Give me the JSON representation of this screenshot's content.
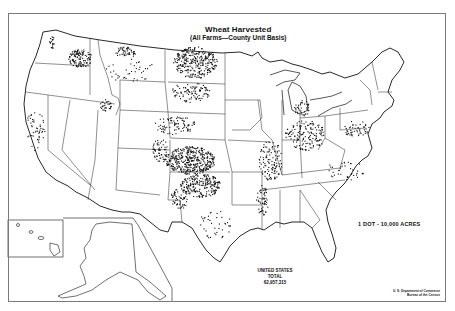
{
  "map": {
    "title": "Wheat Harvested",
    "subtitle": "(All Farms—County Unit Basis)",
    "legend": "1 DOT - 10,000 ACRES",
    "total": {
      "line1": "UNITED STATES",
      "line2": "TOTAL",
      "value": "62,957,315"
    },
    "credit": {
      "line1": "U. S. Department of Commerce",
      "line2": "Bureau of the Census"
    },
    "colors": {
      "ink": "#111111",
      "border": "#7a7a7a",
      "background": "#ffffff"
    },
    "dot_clusters": [
      {
        "name": "palouse-wa",
        "cx": 80,
        "cy": 58,
        "rx": 12,
        "ry": 9,
        "n": 120
      },
      {
        "name": "nw-washington",
        "cx": 52,
        "cy": 42,
        "rx": 3,
        "ry": 6,
        "n": 20
      },
      {
        "name": "north-montana",
        "cx": 125,
        "cy": 52,
        "rx": 10,
        "ry": 6,
        "n": 50
      },
      {
        "name": "montana-scatter",
        "cx": 130,
        "cy": 70,
        "rx": 25,
        "ry": 12,
        "n": 40
      },
      {
        "name": "north-dakota",
        "cx": 195,
        "cy": 62,
        "rx": 22,
        "ry": 16,
        "n": 300
      },
      {
        "name": "south-dakota",
        "cx": 190,
        "cy": 92,
        "rx": 20,
        "ry": 10,
        "n": 100
      },
      {
        "name": "nebraska",
        "cx": 175,
        "cy": 125,
        "rx": 22,
        "ry": 9,
        "n": 90
      },
      {
        "name": "kansas",
        "cx": 190,
        "cy": 160,
        "rx": 25,
        "ry": 14,
        "n": 420
      },
      {
        "name": "oklahoma",
        "cx": 200,
        "cy": 185,
        "rx": 20,
        "ry": 12,
        "n": 230
      },
      {
        "name": "texas-panhandle",
        "cx": 180,
        "cy": 198,
        "rx": 10,
        "ry": 10,
        "n": 60
      },
      {
        "name": "colorado-east",
        "cx": 160,
        "cy": 150,
        "rx": 8,
        "ry": 12,
        "n": 60
      },
      {
        "name": "idaho-south",
        "cx": 105,
        "cy": 105,
        "rx": 6,
        "ry": 6,
        "n": 30
      },
      {
        "name": "illinois-missouri",
        "cx": 270,
        "cy": 160,
        "rx": 12,
        "ry": 20,
        "n": 120
      },
      {
        "name": "indiana-ohio",
        "cx": 305,
        "cy": 135,
        "rx": 20,
        "ry": 15,
        "n": 160
      },
      {
        "name": "michigan",
        "cx": 302,
        "cy": 108,
        "rx": 8,
        "ry": 8,
        "n": 40
      },
      {
        "name": "pennsylvania-md",
        "cx": 355,
        "cy": 128,
        "rx": 14,
        "ry": 8,
        "n": 50
      },
      {
        "name": "virginia-nc",
        "cx": 345,
        "cy": 170,
        "rx": 20,
        "ry": 10,
        "n": 40
      },
      {
        "name": "california",
        "cx": 35,
        "cy": 130,
        "rx": 10,
        "ry": 20,
        "n": 50
      },
      {
        "name": "texas-central",
        "cx": 215,
        "cy": 225,
        "rx": 18,
        "ry": 15,
        "n": 40
      },
      {
        "name": "mississippi-valley",
        "cx": 262,
        "cy": 200,
        "rx": 6,
        "ry": 15,
        "n": 60
      }
    ]
  }
}
